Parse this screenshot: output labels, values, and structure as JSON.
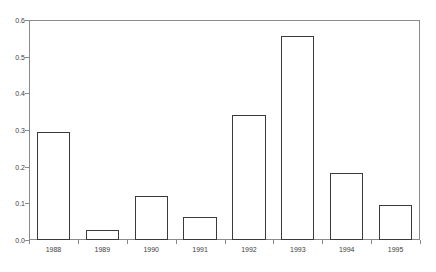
{
  "chart_data": {
    "type": "bar",
    "title": "",
    "subtitle": "",
    "xlabel": "",
    "ylabel": "",
    "categories": [
      "1988",
      "1989",
      "1990",
      "1991",
      "1992",
      "1993",
      "1994",
      "1995"
    ],
    "values": [
      0.295,
      0.027,
      0.12,
      0.063,
      0.341,
      0.556,
      0.183,
      0.095
    ],
    "ylim": [
      0.0,
      0.6
    ],
    "ytick_labels": [
      "0.0",
      "0.1",
      "0.2",
      "0.3",
      "0.4",
      "0.5",
      "0.6"
    ],
    "ytick_values": [
      0.0,
      0.1,
      0.2,
      0.3,
      0.4,
      0.5,
      0.6
    ],
    "grid": false,
    "legend": false,
    "legend_position": "none",
    "bar_fill": "#ffffff",
    "bar_border": "#3a3a3a",
    "frame_color": "#8a8a8a",
    "background": "#ffffff"
  }
}
